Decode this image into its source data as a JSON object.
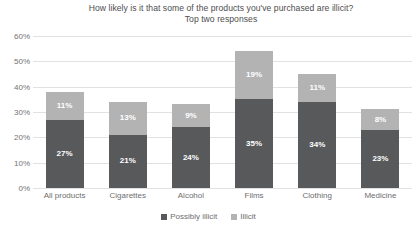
{
  "chart_data": {
    "type": "bar",
    "subtype": "stacked-column",
    "title": "How likely is it that some of the products you've purchased are illicit?",
    "subtitle": "Top two responses",
    "xlabel": "",
    "ylabel": "",
    "ylim": [
      0,
      60
    ],
    "ytick_labels": [
      "0%",
      "10%",
      "20%",
      "30%",
      "40%",
      "50%",
      "60%"
    ],
    "ytick_values": [
      0,
      10,
      20,
      30,
      40,
      50,
      60
    ],
    "grid": true,
    "legend_position": "bottom",
    "value_suffix": "%",
    "categories": [
      "All products",
      "Cigarettes",
      "Alcohol",
      "Films",
      "Clothing",
      "Medicine"
    ],
    "series": [
      {
        "name": "Possibly illicit",
        "color": "#58595b",
        "values": [
          27,
          21,
          24,
          35,
          34,
          23
        ],
        "labels": [
          "27%",
          "21%",
          "24%",
          "35%",
          "34%",
          "23%"
        ]
      },
      {
        "name": "Illicit",
        "color": "#b3b3b3",
        "values": [
          11,
          13,
          9,
          19,
          11,
          8
        ],
        "labels": [
          "11%",
          "13%",
          "9%",
          "19%",
          "11%",
          "8%"
        ]
      }
    ],
    "totals": [
      38,
      34,
      33,
      54,
      45,
      31
    ]
  },
  "colors": {
    "background": "#ffffff",
    "gridline": "#e2e2e2",
    "axis_text": "#737373",
    "title_text": "#4d4d4d",
    "bar_label_text": "#ffffff"
  }
}
